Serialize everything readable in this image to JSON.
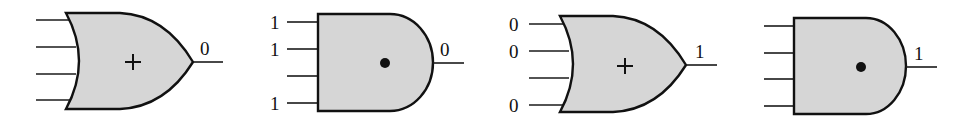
{
  "diagram": {
    "type": "logic-gates",
    "colors": {
      "gate_fill": "#d6d6d6",
      "stroke": "#111111",
      "background": "#ffffff"
    },
    "gates": [
      {
        "kind": "OR",
        "symbol": "+",
        "inputs": [
          "",
          "",
          "",
          ""
        ],
        "output": "0"
      },
      {
        "kind": "AND",
        "symbol": "•",
        "inputs": [
          "1",
          "1",
          "",
          "1"
        ],
        "output": "0"
      },
      {
        "kind": "OR",
        "symbol": "+",
        "inputs": [
          "0",
          "0",
          "",
          "0"
        ],
        "output": "1"
      },
      {
        "kind": "AND",
        "symbol": "•",
        "inputs": [
          "",
          "",
          "",
          ""
        ],
        "output": "1"
      }
    ]
  }
}
